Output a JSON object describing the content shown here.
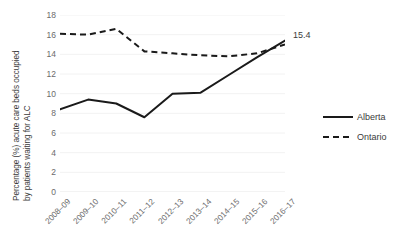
{
  "chart_data": {
    "type": "line",
    "title": "",
    "xlabel": "",
    "ylabel": "Percentage (%) acute care beds occupied by patients waiting for ALC",
    "ylabel_line1": "Percentage (%) acute care beds occupied",
    "ylabel_line2": "by patients waiting for ALC",
    "categories": [
      "2008–09",
      "2009–10",
      "2010–11",
      "2011–12",
      "2012–13",
      "2013–14",
      "2014–15",
      "2015–16",
      "2016–17"
    ],
    "series": [
      {
        "name": "Alberta",
        "style": "solid",
        "color": "#1a1a1a",
        "values": [
          8.4,
          9.4,
          9.0,
          7.6,
          10.0,
          10.1,
          11.9,
          13.7,
          15.4
        ]
      },
      {
        "name": "Ontario",
        "style": "dashed",
        "color": "#1a1a1a",
        "values": [
          16.1,
          16.0,
          16.6,
          14.3,
          14.1,
          13.9,
          13.8,
          14.1,
          15.0
        ]
      }
    ],
    "ylim": [
      0,
      18
    ],
    "yticks": [
      18,
      16,
      14,
      12,
      10,
      8,
      6,
      4,
      2,
      0
    ],
    "grid": true,
    "legend_position": "right",
    "annotations": [
      {
        "text": "15.4",
        "series": "Alberta",
        "category": "2016–17"
      }
    ]
  },
  "legend": {
    "items": [
      {
        "label": "Alberta",
        "style": "solid"
      },
      {
        "label": "Ontario",
        "style": "dashed"
      }
    ]
  }
}
